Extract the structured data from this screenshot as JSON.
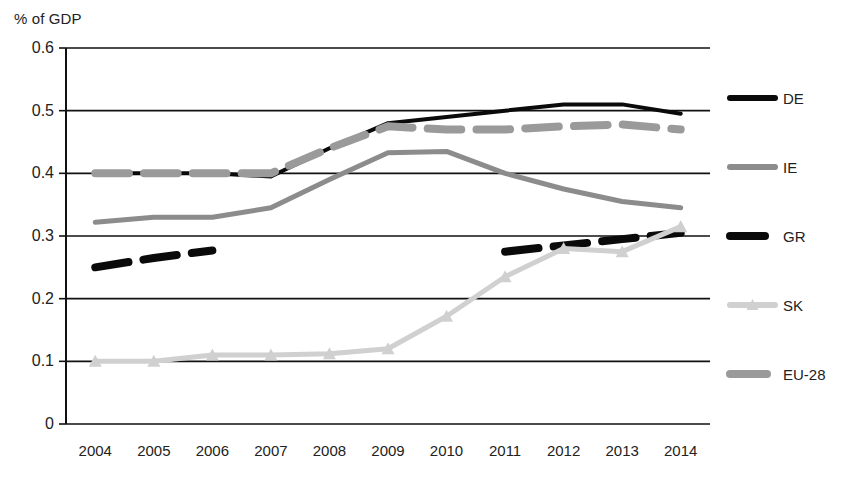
{
  "chart_data": {
    "type": "line",
    "title": "",
    "subtitle": "",
    "ylabel": "% of GDP",
    "xlabel": "",
    "x": [
      "2004",
      "2005",
      "2006",
      "2007",
      "2008",
      "2009",
      "2010",
      "2011",
      "2012",
      "2013",
      "2014"
    ],
    "categories": [
      "2004",
      "2005",
      "2006",
      "2007",
      "2008",
      "2009",
      "2010",
      "2011",
      "2012",
      "2013",
      "2014"
    ],
    "ylim": [
      0,
      0.6
    ],
    "yticks": [
      "0",
      "0.1",
      "0.2",
      "0.3",
      "0.4",
      "0.5",
      "0.6"
    ],
    "ytick_values": [
      0,
      0.1,
      0.2,
      0.3,
      0.4,
      0.5,
      0.6
    ],
    "grid": "horizontal",
    "legend_position": "right",
    "series": [
      {
        "name": "DE",
        "color": "#0a0a0a",
        "style": "solid",
        "width": 4,
        "marker": "none",
        "values": [
          0.4,
          0.4,
          0.4,
          0.395,
          0.44,
          0.48,
          0.49,
          0.5,
          0.51,
          0.51,
          0.495
        ]
      },
      {
        "name": "IE",
        "color": "#8c8c8c",
        "style": "solid",
        "width": 5,
        "marker": "none",
        "values": [
          0.322,
          0.33,
          0.33,
          0.345,
          0.39,
          0.433,
          0.435,
          0.4,
          0.375,
          0.355,
          0.345
        ]
      },
      {
        "name": "GR",
        "color": "#0a0a0a",
        "style": "dashed",
        "width": 8,
        "marker": "none",
        "values": [
          0.25,
          0.265,
          0.277,
          null,
          null,
          null,
          null,
          0.275,
          0.285,
          0.295,
          0.305
        ]
      },
      {
        "name": "SK",
        "color": "#d0d0d0",
        "style": "solid",
        "width": 5,
        "marker": "triangle",
        "values": [
          0.1,
          0.1,
          0.11,
          0.11,
          0.112,
          0.12,
          0.172,
          0.235,
          0.28,
          0.275,
          0.315
        ]
      },
      {
        "name": "EU-28",
        "color": "#9a9a9a",
        "style": "dashed",
        "width": 8,
        "marker": "none",
        "values": [
          0.4,
          0.4,
          0.4,
          0.4,
          0.44,
          0.475,
          0.47,
          0.47,
          0.475,
          0.478,
          0.47
        ]
      }
    ]
  },
  "legend": {
    "items": [
      {
        "label": "DE"
      },
      {
        "label": "IE"
      },
      {
        "label": "GR"
      },
      {
        "label": "SK"
      },
      {
        "label": "EU-28"
      }
    ]
  }
}
